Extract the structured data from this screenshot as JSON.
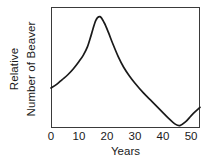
{
  "chart_data": {
    "type": "line",
    "title": "",
    "xlabel": "Years",
    "ylabel_lines": [
      "Relative",
      "Number of Beaver"
    ],
    "ylabel": "Relative Number of Beaver",
    "xlim": [
      0,
      53.2
    ],
    "ylim": [
      0,
      1
    ],
    "xticks": [
      0,
      10,
      20,
      30,
      40,
      50
    ],
    "xtick_labels": [
      "0",
      "10",
      "20",
      "30",
      "40",
      "50"
    ],
    "yticks": [],
    "ytick_labels": [],
    "grid": false,
    "legend": false,
    "frame": "full-box",
    "series": [
      {
        "name": "Relative Number of Beaver",
        "color": "#1a1a1a",
        "linewidth": 1.7,
        "x": [
          0,
          2,
          4,
          6,
          8,
          10,
          11.5,
          13,
          14.5,
          16,
          17.5,
          19,
          20.5,
          22,
          24,
          26,
          28,
          30,
          33,
          36,
          39,
          42,
          44.5,
          46,
          48,
          50,
          51.5,
          53.2
        ],
        "y": [
          0.33,
          0.36,
          0.4,
          0.44,
          0.49,
          0.55,
          0.6,
          0.67,
          0.78,
          0.89,
          0.92,
          0.87,
          0.79,
          0.7,
          0.59,
          0.5,
          0.43,
          0.37,
          0.29,
          0.22,
          0.15,
          0.08,
          0.03,
          0.02,
          0.05,
          0.1,
          0.135,
          0.17
        ]
      }
    ]
  },
  "axes": {
    "x_axis_title": "Years",
    "y_axis_title_top": "Relative",
    "y_axis_title_bottom": "Number of Beaver"
  },
  "colors": {
    "background": "#ffffff",
    "frame": "#3a3a3a",
    "curve": "#1a1a1a",
    "text": "#1a1a1a"
  }
}
